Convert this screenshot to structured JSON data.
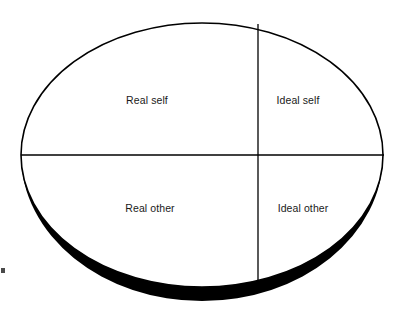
{
  "figure": {
    "type": "quadrant-ellipse-diagram",
    "background_color": "#ffffff",
    "outline_color": "#000000",
    "shadow_color": "#000000",
    "text_color": "#1a1a1a",
    "ellipse": {
      "center_x": 202,
      "center_y": 155,
      "radius_x": 181,
      "radius_y": 132,
      "stroke_width": 1.6
    },
    "divider_horizontal": {
      "x1": 21,
      "y1": 155,
      "x2": 384,
      "y2": 155
    },
    "divider_vertical": {
      "x1": 258,
      "y1": 24,
      "x2": 258,
      "y2": 288
    },
    "shadow": {
      "description": "thick black crescent along lower rim giving a 3D disc look",
      "max_thickness": 14
    },
    "artifacts": [
      {
        "name": "scan-speck-left",
        "x": 1,
        "y": 268,
        "width": 4,
        "height": 5
      }
    ]
  },
  "quadrants": [
    {
      "id": "real-self",
      "label": "Real self",
      "position": "top-left",
      "cx": 147,
      "cy": 100
    },
    {
      "id": "ideal-self",
      "label": "Ideal self",
      "position": "top-right",
      "cx": 298,
      "cy": 100
    },
    {
      "id": "real-other",
      "label": "Real other",
      "position": "bottom-left",
      "cx": 150,
      "cy": 208
    },
    {
      "id": "ideal-other",
      "label": "Ideal other",
      "position": "bottom-right",
      "cx": 303,
      "cy": 208
    }
  ]
}
